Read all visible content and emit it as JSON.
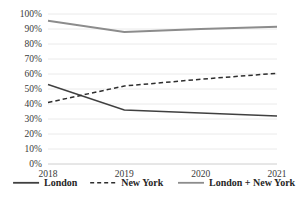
{
  "chart_data": {
    "type": "line",
    "title": "",
    "subtitle": "",
    "xlabel": "",
    "ylabel": "",
    "categories": [
      "2018",
      "2019",
      "2020",
      "2021"
    ],
    "x_tick_labels": [
      "2018",
      "2019",
      "2020",
      "2021"
    ],
    "y_tick_labels": [
      "0%",
      "10%",
      "20%",
      "30%",
      "40%",
      "50%",
      "60%",
      "70%",
      "80%",
      "90%",
      "100%"
    ],
    "y_tick_values": [
      0,
      10,
      20,
      30,
      40,
      50,
      60,
      70,
      80,
      90,
      100
    ],
    "ylim": [
      0,
      100
    ],
    "y_unit": "%",
    "grid": "horizontal",
    "legend_position": "bottom",
    "series": [
      {
        "name": "London",
        "values": [
          53,
          36,
          34,
          32
        ],
        "color": "#404040",
        "style": "solid",
        "width": 1.5
      },
      {
        "name": "New York",
        "values": [
          41,
          52,
          56.5,
          60.5
        ],
        "color": "#2e2e2e",
        "style": "dashed",
        "width": 1.5
      },
      {
        "name": "London + New York",
        "values": [
          95.5,
          88,
          90,
          91.5
        ],
        "color": "#8c8c8c",
        "style": "solid",
        "width": 1.8
      }
    ]
  },
  "legend": {
    "items": [
      {
        "label": "London",
        "color": "#404040",
        "style": "solid"
      },
      {
        "label": "New York",
        "color": "#2e2e2e",
        "style": "dashed"
      },
      {
        "label": "London + New York",
        "color": "#8c8c8c",
        "style": "solid"
      }
    ]
  },
  "colors": {
    "gridline": "#e4e4e4",
    "axis": "#c8c8c8",
    "tick_text": "#3a3a3a",
    "legend_text": "#262626",
    "background": "#ffffff"
  }
}
